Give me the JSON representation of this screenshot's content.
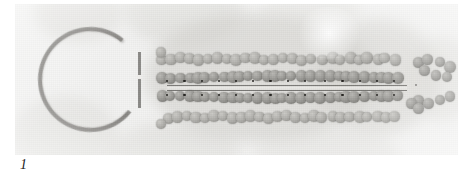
{
  "figure": {
    "label": "1",
    "kind": "electron-micrograph",
    "plate": {
      "x": 15,
      "y": 4,
      "width": 443,
      "height": 151,
      "base_tone": "#f3f3f2"
    }
  },
  "palette": {
    "plate_background": "#f3f3f2",
    "bead_core": "#9b9a96",
    "bead_rim": "#74736f",
    "bead_pale": "#b0afab",
    "dot": "#242320",
    "ring_stroke": "#8e8d8a",
    "striation_dark": "#6f6e6a",
    "striation_light": "#e9e8e5",
    "label_color": "#1c1c1c"
  },
  "structures": {
    "ring": {
      "name": "circular ring profile",
      "cx": 75,
      "cy": 75,
      "diameter": 105,
      "stroke_width": 4,
      "gap_side": "right",
      "gap_bar": {
        "x": 126,
        "y": 48,
        "width": 3,
        "height": 56
      }
    },
    "array": {
      "name": "paracrystalline bead array",
      "bead_diameter": 11,
      "rows": [
        {
          "id": "row-outer-top",
          "y": 55,
          "tone": "pale",
          "dots": false,
          "segments": [
            {
              "x0": 148,
              "x1": 300,
              "spacing": 9.2,
              "count": 17
            },
            {
              "x0": 308,
              "x1": 388,
              "spacing": 9.0,
              "count": 9
            }
          ],
          "lead_bead": {
            "x": 146,
            "y": 48
          }
        },
        {
          "id": "row-inner-top",
          "y": 73,
          "tone": "dark",
          "dots": true,
          "segments": [
            {
              "x0": 148,
              "x1": 300,
              "spacing": 8.6,
              "count": 18
            },
            {
              "x0": 306,
              "x1": 390,
              "spacing": 8.6,
              "count": 10
            }
          ]
        },
        {
          "id": "row-inner-bottom",
          "y": 93,
          "tone": "dark",
          "dots": true,
          "segments": [
            {
              "x0": 148,
              "x1": 300,
              "spacing": 8.6,
              "count": 18
            },
            {
              "x0": 306,
              "x1": 390,
              "spacing": 8.6,
              "count": 10
            }
          ]
        },
        {
          "id": "row-outer-bottom",
          "y": 113,
          "tone": "pale",
          "dots": false,
          "segments": [
            {
              "x0": 152,
              "x1": 300,
              "spacing": 9.2,
              "count": 17
            },
            {
              "x0": 308,
              "x1": 390,
              "spacing": 9.0,
              "count": 9
            }
          ],
          "lead_bead": {
            "x": 146,
            "y": 120
          }
        }
      ],
      "striations": [
        {
          "id": "striation-dark-upper",
          "x": 152,
          "y": 81,
          "width": 240,
          "style": "dark"
        },
        {
          "id": "striation-light",
          "x": 152,
          "y": 83,
          "width": 240,
          "style": "light"
        },
        {
          "id": "striation-dark-lower",
          "x": 152,
          "y": 86,
          "width": 240,
          "style": "dark"
        }
      ],
      "dot_row_spacing": 17.2
    },
    "chevron": {
      "name": "terminal chevron cluster",
      "beads": [
        {
          "x": 402,
          "y": 58
        },
        {
          "x": 414,
          "y": 55
        },
        {
          "x": 426,
          "y": 58
        },
        {
          "x": 434,
          "y": 64
        },
        {
          "x": 408,
          "y": 68
        },
        {
          "x": 420,
          "y": 71
        },
        {
          "x": 431,
          "y": 74
        },
        {
          "x": 404,
          "y": 96
        },
        {
          "x": 414,
          "y": 99
        },
        {
          "x": 425,
          "y": 95
        },
        {
          "x": 436,
          "y": 92
        },
        {
          "x": 395,
          "y": 101
        },
        {
          "x": 405,
          "y": 105
        }
      ],
      "center_speck": {
        "x": 400,
        "y": 80
      }
    },
    "background_blobs": [
      {
        "x": 18,
        "y": -22,
        "w": 90,
        "h": 60,
        "color": "#dcdbd7",
        "opacity": 0.55
      },
      {
        "x": 108,
        "y": -30,
        "w": 120,
        "h": 72,
        "color": "#d9d8d4",
        "opacity": 0.5
      },
      {
        "x": 130,
        "y": 8,
        "w": 230,
        "h": 130,
        "color": "#d5d4d0",
        "opacity": 0.62
      },
      {
        "x": 300,
        "y": 14,
        "w": 125,
        "h": 118,
        "color": "#d8d7d3",
        "opacity": 0.58
      },
      {
        "x": 392,
        "y": 32,
        "w": 70,
        "h": 86,
        "color": "#dddcd8",
        "opacity": 0.5
      },
      {
        "x": -6,
        "y": 92,
        "w": 110,
        "h": 86,
        "color": "#dbdad6",
        "opacity": 0.5
      },
      {
        "x": 96,
        "y": 118,
        "w": 130,
        "h": 60,
        "color": "#d9d8d4",
        "opacity": 0.48
      },
      {
        "x": 236,
        "y": 124,
        "w": 150,
        "h": 58,
        "color": "#dddcd8",
        "opacity": 0.45
      },
      {
        "x": 246,
        "y": -18,
        "w": 100,
        "h": 46,
        "color": "#e0dfdb",
        "opacity": 0.42
      }
    ]
  }
}
